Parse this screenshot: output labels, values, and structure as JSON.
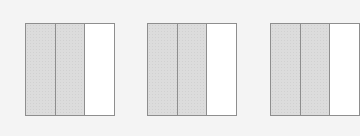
{
  "diagram": {
    "colors": {
      "background": "#f4f4f4",
      "border": "#8e8e8e",
      "shaded": "#dcdcdc",
      "unshaded": "#ffffff"
    },
    "shapes": [
      {
        "left": 25,
        "parts": 3,
        "shaded": 2,
        "fraction": "2/3"
      },
      {
        "left": 147,
        "parts": 3,
        "shaded": 2,
        "fraction": "2/3"
      },
      {
        "left": 270,
        "parts": 3,
        "shaded": 2,
        "fraction": "2/3"
      }
    ]
  }
}
